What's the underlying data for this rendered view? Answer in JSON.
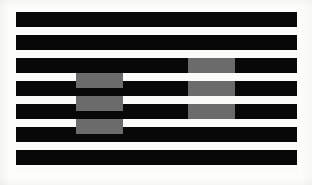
{
  "figure": {
    "canvas": {
      "width": 312,
      "height": 185
    },
    "background_color": "#ffffff",
    "paper_color": "#fdfdfb"
  },
  "plate": {
    "x": 16,
    "y": 12,
    "width": 281,
    "height": 161,
    "white_color": "#fbfbf9"
  },
  "grating": {
    "bar_color": "#080808",
    "white_color": "#fbfbf9",
    "bar_count": 7,
    "bar_left": 16,
    "bar_width": 281,
    "bar_height": 15,
    "period": 23,
    "bars": [
      {
        "index": 1,
        "y": 12,
        "height": 15
      },
      {
        "index": 2,
        "y": 35,
        "height": 15
      },
      {
        "index": 3,
        "y": 58,
        "height": 15
      },
      {
        "index": 4,
        "y": 81,
        "height": 15
      },
      {
        "index": 5,
        "y": 104,
        "height": 15
      },
      {
        "index": 6,
        "y": 127,
        "height": 15
      },
      {
        "index": 7,
        "y": 150,
        "height": 15
      }
    ]
  },
  "test_patches": {
    "gray_color": "#6b6b6b",
    "left_group": {
      "label": "gray patches on white background",
      "placement": "white-stripe",
      "x": 76,
      "width": 47,
      "patches": [
        {
          "index": 1,
          "y": 73,
          "height": 15
        },
        {
          "index": 2,
          "y": 96,
          "height": 15
        },
        {
          "index": 3,
          "y": 119,
          "height": 15
        }
      ]
    },
    "right_group": {
      "label": "gray patches on black background",
      "placement": "black-bar",
      "x": 188,
      "width": 47,
      "patches": [
        {
          "index": 1,
          "y": 58,
          "height": 15
        },
        {
          "index": 2,
          "y": 81,
          "height": 15
        },
        {
          "index": 3,
          "y": 104,
          "height": 15
        }
      ]
    }
  }
}
